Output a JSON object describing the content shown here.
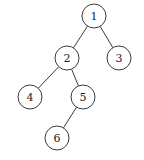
{
  "diagram": {
    "type": "binary-tree",
    "colors": {
      "stroke": "#3a3a3a",
      "fill": "#ffffff",
      "text": "#222222",
      "background": "#ffffff"
    },
    "node_radius": 12,
    "nodes": [
      {
        "id": "1",
        "label": "1",
        "x": 94,
        "y": 16
      },
      {
        "id": "2",
        "label": "2",
        "x": 67,
        "y": 58
      },
      {
        "id": "3",
        "label": "3",
        "x": 119,
        "y": 58
      },
      {
        "id": "4",
        "label": "4",
        "x": 30,
        "y": 97
      },
      {
        "id": "5",
        "label": "5",
        "x": 83,
        "y": 97
      },
      {
        "id": "6",
        "label": "6",
        "x": 57,
        "y": 138
      }
    ],
    "edges": [
      {
        "from": "1",
        "to": "2"
      },
      {
        "from": "1",
        "to": "3"
      },
      {
        "from": "2",
        "to": "4"
      },
      {
        "from": "2",
        "to": "5"
      },
      {
        "from": "5",
        "to": "6"
      }
    ]
  }
}
